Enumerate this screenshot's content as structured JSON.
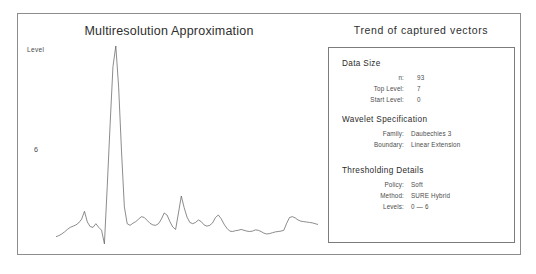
{
  "figure": {
    "chart": {
      "title": "Multiresolution Approximation",
      "axis_label": "Level",
      "level_tick": "6"
    },
    "trend": {
      "title": "Trend of captured vectors",
      "sections": [
        {
          "heading": "Data Size",
          "rows": [
            {
              "key": "n:",
              "value": "93"
            },
            {
              "key": "Top Level:",
              "value": "7"
            },
            {
              "key": "Start Level:",
              "value": "0"
            }
          ]
        },
        {
          "heading": "Wavelet Specification",
          "rows": [
            {
              "key": "Family:",
              "value": "Daubechies 3"
            },
            {
              "key": "Boundary:",
              "value": "Linear Extension"
            }
          ]
        },
        {
          "heading": "Thresholding Details",
          "rows": [
            {
              "key": "Policy:",
              "value": "Soft"
            },
            {
              "key": "Method:",
              "value": "SURE Hybrid"
            },
            {
              "key": "Levels:",
              "value": "0 — 6"
            }
          ]
        }
      ]
    }
  },
  "chart_data": {
    "type": "line",
    "title": "Multiresolution Approximation",
    "xlabel": "",
    "ylabel": "Level",
    "ylim": [
      0,
      1
    ],
    "xlim": [
      0,
      93
    ],
    "grid": false,
    "legend": null,
    "series": [
      {
        "name": "Level 6 approximation",
        "x": [
          0,
          1,
          2,
          3,
          4,
          5,
          6,
          7,
          8,
          9,
          10,
          11,
          12,
          13,
          14,
          15,
          16,
          17,
          18,
          19,
          20,
          21,
          22,
          23,
          24,
          25,
          26,
          27,
          28,
          29,
          30,
          31,
          32,
          33,
          34,
          35,
          36,
          37,
          38,
          39,
          40,
          41,
          42,
          43,
          44,
          45,
          46,
          47,
          48,
          49,
          50,
          51,
          52,
          53,
          54,
          55,
          56,
          57,
          58,
          59,
          60,
          61,
          62,
          63,
          64,
          65,
          66,
          67,
          68,
          69,
          70,
          71,
          72,
          73,
          74,
          75,
          76,
          77,
          78,
          79,
          80,
          81,
          82,
          83,
          84,
          85,
          86,
          87,
          88,
          89,
          90,
          91,
          92
        ],
        "values": [
          0.055,
          0.06,
          0.068,
          0.078,
          0.09,
          0.1,
          0.106,
          0.112,
          0.122,
          0.14,
          0.178,
          0.126,
          0.104,
          0.1,
          0.118,
          0.1,
          0.086,
          0.02,
          0.3,
          0.6,
          0.88,
          0.98,
          0.78,
          0.47,
          0.2,
          0.118,
          0.11,
          0.12,
          0.128,
          0.14,
          0.152,
          0.148,
          0.134,
          0.12,
          0.112,
          0.11,
          0.118,
          0.14,
          0.17,
          0.16,
          0.128,
          0.102,
          0.09,
          0.17,
          0.252,
          0.196,
          0.15,
          0.124,
          0.118,
          0.124,
          0.136,
          0.128,
          0.112,
          0.106,
          0.11,
          0.122,
          0.148,
          0.16,
          0.142,
          0.116,
          0.096,
          0.082,
          0.08,
          0.084,
          0.086,
          0.09,
          0.086,
          0.082,
          0.08,
          0.082,
          0.088,
          0.086,
          0.08,
          0.072,
          0.068,
          0.07,
          0.074,
          0.078,
          0.08,
          0.082,
          0.086,
          0.12,
          0.148,
          0.152,
          0.146,
          0.136,
          0.13,
          0.128,
          0.126,
          0.124,
          0.122,
          0.118,
          0.114
        ]
      }
    ]
  }
}
